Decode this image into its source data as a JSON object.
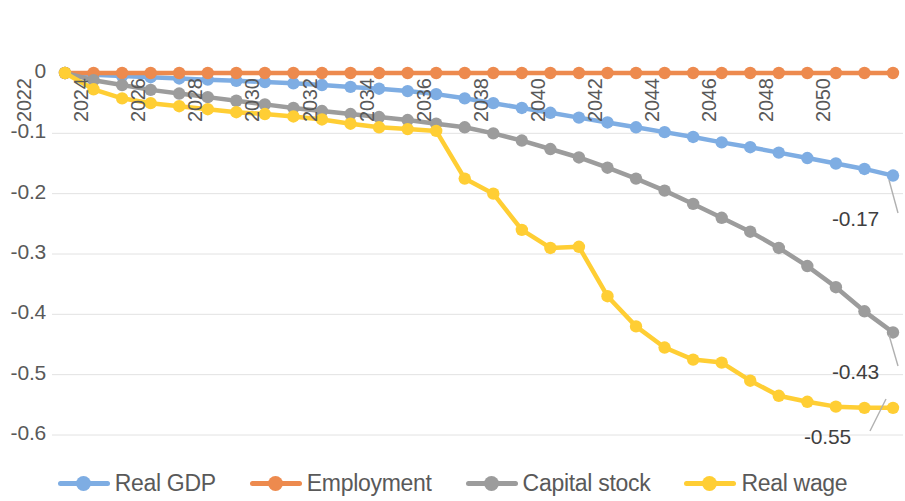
{
  "chart_data": {
    "type": "line",
    "title": "",
    "subtitle": "",
    "xlabel": "",
    "ylabel": "",
    "grid": true,
    "legend_position": "bottom",
    "ylim": [
      -0.6,
      0.0
    ],
    "yticks": [
      0,
      -0.1,
      -0.2,
      -0.3,
      -0.4,
      -0.5,
      -0.6
    ],
    "ytick_labels": [
      "0",
      "-0.1",
      "-0.2",
      "-0.3",
      "-0.4",
      "-0.5",
      "-0.6"
    ],
    "x": [
      2022,
      2023,
      2024,
      2025,
      2026,
      2027,
      2028,
      2029,
      2030,
      2031,
      2032,
      2033,
      2034,
      2035,
      2036,
      2037,
      2038,
      2039,
      2040,
      2041,
      2042,
      2043,
      2044,
      2045,
      2046,
      2047,
      2048,
      2049,
      2050,
      2051
    ],
    "xtick_labels": [
      "2022",
      "2024",
      "2026",
      "2028",
      "2030",
      "2032",
      "2034",
      "2036",
      "2038",
      "2040",
      "2042",
      "2044",
      "2046",
      "2048",
      "2050"
    ],
    "xtick_values": [
      2022,
      2024,
      2026,
      2028,
      2030,
      2032,
      2034,
      2036,
      2038,
      2040,
      2042,
      2044,
      2046,
      2048,
      2050
    ],
    "series": [
      {
        "name": "Real GDP",
        "color": "#7EADE3",
        "values": [
          0,
          -0.003,
          -0.005,
          -0.007,
          -0.009,
          -0.011,
          -0.013,
          -0.015,
          -0.017,
          -0.02,
          -0.023,
          -0.026,
          -0.03,
          -0.035,
          -0.042,
          -0.05,
          -0.058,
          -0.066,
          -0.074,
          -0.082,
          -0.09,
          -0.098,
          -0.106,
          -0.115,
          -0.123,
          -0.132,
          -0.141,
          -0.15,
          -0.159,
          -0.17
        ],
        "end_label": "-0.17"
      },
      {
        "name": "Employment",
        "color": "#ED8A4E",
        "values": [
          0,
          0,
          0,
          0,
          0,
          0,
          0,
          0,
          0,
          0,
          0,
          0,
          0,
          0,
          0,
          0,
          0,
          0,
          0,
          0,
          0,
          0,
          0,
          0,
          0,
          0,
          0,
          0,
          0,
          0
        ],
        "end_label": ""
      },
      {
        "name": "Capital stock",
        "color": "#9C9C9C",
        "values": [
          0,
          -0.012,
          -0.02,
          -0.028,
          -0.034,
          -0.04,
          -0.046,
          -0.052,
          -0.058,
          -0.063,
          -0.068,
          -0.073,
          -0.078,
          -0.084,
          -0.09,
          -0.1,
          -0.112,
          -0.126,
          -0.14,
          -0.157,
          -0.175,
          -0.195,
          -0.217,
          -0.24,
          -0.263,
          -0.29,
          -0.32,
          -0.355,
          -0.395,
          -0.43
        ],
        "end_label": "-0.43"
      },
      {
        "name": "Real wage",
        "color": "#FFCE34",
        "values": [
          0,
          -0.027,
          -0.042,
          -0.05,
          -0.055,
          -0.06,
          -0.065,
          -0.068,
          -0.072,
          -0.077,
          -0.084,
          -0.09,
          -0.093,
          -0.096,
          -0.175,
          -0.2,
          -0.26,
          -0.29,
          -0.288,
          -0.37,
          -0.42,
          -0.455,
          -0.475,
          -0.48,
          -0.51,
          -0.535,
          -0.545,
          -0.553,
          -0.555,
          -0.555
        ],
        "end_label": "-0.55"
      }
    ],
    "annotations": [
      {
        "text": "-0.17",
        "series": "Real GDP",
        "x": 2051,
        "y": -0.17
      },
      {
        "text": "-0.43",
        "series": "Capital stock",
        "x": 2051,
        "y": -0.43
      },
      {
        "text": "-0.55",
        "series": "Real wage",
        "x": 2051,
        "y": -0.55
      }
    ]
  },
  "legend": {
    "items": [
      {
        "label": "Real GDP",
        "color": "#7EADE3"
      },
      {
        "label": "Employment",
        "color": "#ED8A4E"
      },
      {
        "label": "Capital stock",
        "color": "#9C9C9C"
      },
      {
        "label": "Real wage",
        "color": "#FFCE34"
      }
    ]
  }
}
